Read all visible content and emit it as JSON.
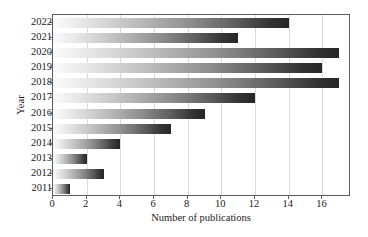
{
  "chart_data": {
    "type": "bar",
    "orientation": "horizontal",
    "title": "",
    "xlabel": "Number of publications",
    "ylabel": "Year",
    "categories": [
      "2011",
      "2012",
      "2013",
      "2014",
      "2015",
      "2016",
      "2017",
      "2018",
      "2019",
      "2020",
      "2021",
      "2022"
    ],
    "values": [
      1,
      3,
      2,
      4,
      7,
      9,
      12,
      17,
      16,
      17,
      11,
      14
    ],
    "xlim": [
      0,
      17.7
    ],
    "xticks": [
      "0",
      "2",
      "4",
      "6",
      "8",
      "10",
      "12",
      "14",
      "16"
    ],
    "xtick_values": [
      0,
      2,
      4,
      6,
      8,
      10,
      12,
      14,
      16
    ],
    "yticks": [
      "2022",
      "2021",
      "2020",
      "2019",
      "2018",
      "2017",
      "2016",
      "2015",
      "2014",
      "2013",
      "2012",
      "2011"
    ],
    "grid": "vertical",
    "legend": "none",
    "bar_gradient": [
      "#fbfbfb",
      "#262626"
    ],
    "axis_color": "#5b5b66",
    "grid_color": "#d9d9de",
    "background": "#ffffff"
  }
}
